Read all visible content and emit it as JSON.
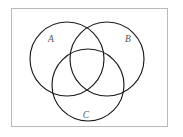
{
  "figure": {
    "background_color": "#ffffff",
    "frame": {
      "name": "diagram-border",
      "x": 11.5,
      "y": 8.5,
      "width": 156,
      "height": 118,
      "stroke_color": "#b9b9b9",
      "fill_color": "#ffffff",
      "stroke_width": 1
    },
    "circle_stroke_color": "#1a1a1a",
    "circle_stroke_width": 1.15,
    "label_color": "#555555",
    "sets": [
      {
        "id": "A",
        "label": "A",
        "cx": 67,
        "cy": 59,
        "r": 37,
        "label_x": 51,
        "label_y": 42
      },
      {
        "id": "B",
        "label": "B",
        "cx": 107,
        "cy": 59,
        "r": 37,
        "label_x": 128,
        "label_y": 42
      },
      {
        "id": "C",
        "label": "C",
        "cx": 88,
        "cy": 85,
        "r": 36,
        "label_x": 86,
        "label_y": 118
      }
    ]
  }
}
